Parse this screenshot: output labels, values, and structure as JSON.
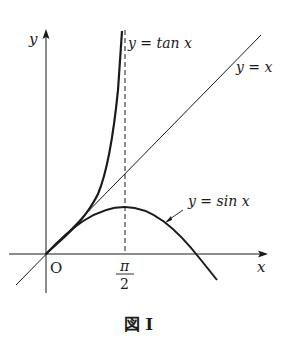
{
  "figure": {
    "caption": "図 I",
    "axes": {
      "x_label": "x",
      "y_label": "y",
      "origin_label": "O",
      "tick_label_numerator": "π",
      "tick_label_denominator": "2"
    },
    "curves": [
      {
        "name": "tan",
        "label": "y = tan x"
      },
      {
        "name": "identity",
        "label": "y = x"
      },
      {
        "name": "sin",
        "label": "y = sin x"
      }
    ],
    "colors": {
      "ink": "#1a1a1a",
      "background": "#ffffff"
    }
  }
}
